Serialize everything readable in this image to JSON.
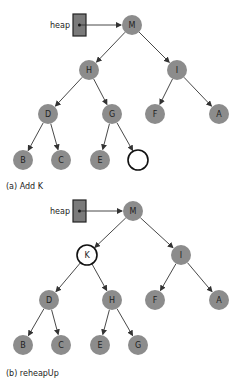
{
  "colors": {
    "node_fill": "#8c8c8c",
    "highlight_fill": "#ffffff",
    "edge": "#333333",
    "heap_box": "#7a7a7a"
  },
  "panel_a": {
    "caption": "(a) Add K",
    "heap_label": "heap",
    "nodes": [
      {
        "id": "M",
        "label": "M",
        "x": 132,
        "y": 25,
        "highlight": false
      },
      {
        "id": "H",
        "label": "H",
        "x": 89,
        "y": 70,
        "highlight": false
      },
      {
        "id": "I",
        "label": "I",
        "x": 177,
        "y": 70,
        "highlight": false
      },
      {
        "id": "D",
        "label": "D",
        "x": 48,
        "y": 114,
        "highlight": false
      },
      {
        "id": "G",
        "label": "G",
        "x": 112,
        "y": 114,
        "highlight": false
      },
      {
        "id": "F",
        "label": "F",
        "x": 155,
        "y": 114,
        "highlight": false
      },
      {
        "id": "A",
        "label": "A",
        "x": 219,
        "y": 114,
        "highlight": false
      },
      {
        "id": "B",
        "label": "B",
        "x": 23,
        "y": 160,
        "highlight": false
      },
      {
        "id": "C",
        "label": "C",
        "x": 61,
        "y": 160,
        "highlight": false
      },
      {
        "id": "E",
        "label": "E",
        "x": 100,
        "y": 160,
        "highlight": false
      },
      {
        "id": "empty",
        "label": "",
        "x": 138,
        "y": 160,
        "highlight": true
      }
    ],
    "edges": [
      [
        "M",
        "H"
      ],
      [
        "M",
        "I"
      ],
      [
        "H",
        "D"
      ],
      [
        "H",
        "G"
      ],
      [
        "I",
        "F"
      ],
      [
        "I",
        "A"
      ],
      [
        "D",
        "B"
      ],
      [
        "D",
        "C"
      ],
      [
        "G",
        "E"
      ],
      [
        "G",
        "empty"
      ]
    ]
  },
  "panel_b": {
    "caption": "(b) reheapUp",
    "heap_label": "heap",
    "nodes": [
      {
        "id": "M",
        "label": "M",
        "x": 133,
        "y": 211,
        "highlight": false
      },
      {
        "id": "K",
        "label": "K",
        "x": 87,
        "y": 255,
        "highlight": true
      },
      {
        "id": "I",
        "label": "I",
        "x": 181,
        "y": 255,
        "highlight": false
      },
      {
        "id": "D",
        "label": "D",
        "x": 49,
        "y": 300,
        "highlight": false
      },
      {
        "id": "H",
        "label": "H",
        "x": 112,
        "y": 300,
        "highlight": false
      },
      {
        "id": "F",
        "label": "F",
        "x": 155,
        "y": 300,
        "highlight": false
      },
      {
        "id": "A",
        "label": "A",
        "x": 219,
        "y": 300,
        "highlight": false
      },
      {
        "id": "B",
        "label": "B",
        "x": 23,
        "y": 345,
        "highlight": false
      },
      {
        "id": "C",
        "label": "C",
        "x": 61,
        "y": 345,
        "highlight": false
      },
      {
        "id": "E",
        "label": "E",
        "x": 100,
        "y": 345,
        "highlight": false
      },
      {
        "id": "G",
        "label": "G",
        "x": 138,
        "y": 345,
        "highlight": false
      }
    ],
    "edges": [
      [
        "M",
        "K"
      ],
      [
        "M",
        "I"
      ],
      [
        "K",
        "D"
      ],
      [
        "K",
        "H"
      ],
      [
        "I",
        "F"
      ],
      [
        "I",
        "A"
      ],
      [
        "D",
        "B"
      ],
      [
        "D",
        "C"
      ],
      [
        "H",
        "E"
      ],
      [
        "H",
        "G"
      ]
    ]
  },
  "figure_caption": "Figure 9.x  The reheapUp operation"
}
